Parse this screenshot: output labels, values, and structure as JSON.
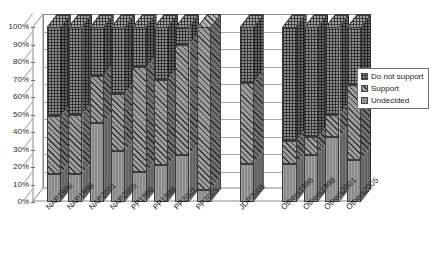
{
  "chart_data": {
    "type": "bar",
    "subtype": "stacked-100-percent-3d-column",
    "title": "",
    "subtitle": "",
    "xlabel": "",
    "ylabel": "",
    "ylim": [
      0,
      100
    ],
    "grid": true,
    "legend_position": "right",
    "y_tick_labels": [
      "100%",
      "90%",
      "80%",
      "70%",
      "60%",
      "50%",
      "40%",
      "30%",
      "20%",
      "10%",
      "0%"
    ],
    "y_ticks": [
      100,
      90,
      80,
      70,
      60,
      50,
      40,
      30,
      20,
      10,
      0
    ],
    "categories": [
      "NAP1996",
      "NAP1998",
      "NAP2001",
      "NAP2005",
      "PP1996",
      "PP1998",
      "PP2001",
      "PP2005",
      "JDP2005",
      "Others1996",
      "Others1998",
      "Others2001",
      "Others2005"
    ],
    "series": [
      {
        "name": "Undecided",
        "values": [
          16,
          16,
          45,
          29,
          17,
          21,
          27,
          7,
          22,
          22,
          27,
          37,
          24
        ]
      },
      {
        "name": "Support",
        "values": [
          33,
          34,
          27,
          33,
          60,
          49,
          63,
          93,
          46,
          13,
          10,
          13,
          43
        ]
      },
      {
        "name": "Do not support",
        "values": [
          51,
          50,
          28,
          38,
          23,
          30,
          10,
          0,
          32,
          65,
          63,
          50,
          33
        ]
      }
    ],
    "legend": [
      {
        "label": "Do not support",
        "pattern": "fine-crosshatch-grid",
        "color": "#8e8e8e"
      },
      {
        "label": "Support",
        "pattern": "diagonal-hatch",
        "color": "#9b9b9b"
      },
      {
        "label": "Undecided",
        "pattern": "solid-vertical-fine",
        "color": "#8a8a8a"
      }
    ],
    "group_gaps_after": [
      "PP2005",
      "JDP2005"
    ]
  }
}
